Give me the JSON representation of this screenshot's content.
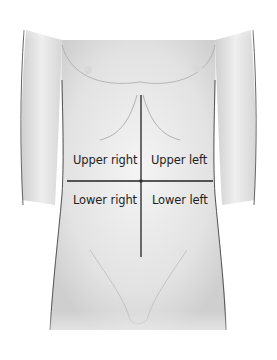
{
  "diagram": {
    "quadrants": [
      {
        "id": "upper-right",
        "label": "Upper right"
      },
      {
        "id": "upper-left",
        "label": "Upper left"
      },
      {
        "id": "lower-right",
        "label": "Lower right"
      },
      {
        "id": "lower-left",
        "label": "Lower left"
      }
    ],
    "colors": {
      "line": "#222222",
      "skin_shade": "#cfcfcf",
      "outline": "#555555",
      "text": "#1e1e1e"
    }
  }
}
